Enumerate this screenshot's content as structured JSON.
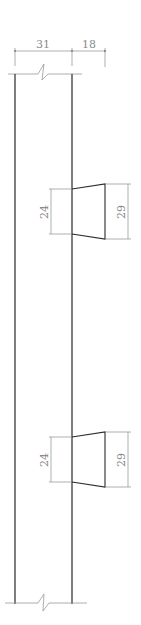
{
  "drawing": {
    "type": "section-detail",
    "top_dimensions": {
      "wall_thickness": "31",
      "projection": "18"
    },
    "elements": [
      {
        "name": "corbel-upper",
        "inner_height": "24",
        "outer_height": "29"
      },
      {
        "name": "corbel-lower",
        "inner_height": "24",
        "outer_height": "29"
      }
    ],
    "break_lines": [
      "top",
      "bottom"
    ],
    "colors": {
      "object_line": "#2a2a2a",
      "dimension_line": "#8c8c8c",
      "background": "#ffffff"
    }
  }
}
